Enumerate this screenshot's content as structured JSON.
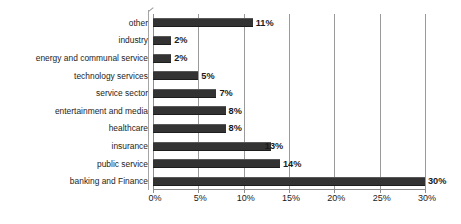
{
  "chart_data": {
    "type": "bar",
    "orientation": "horizontal",
    "title": "",
    "subtitle": "",
    "xlabel": "",
    "ylabel": "",
    "categories": [
      "other",
      "industry",
      "energy and communal service",
      "technology services",
      "service sector",
      "entertainment and media",
      "healthcare",
      "insurance",
      "public service",
      "banking and Finance"
    ],
    "values": [
      11,
      2,
      2,
      5,
      7,
      8,
      8,
      13,
      14,
      30
    ],
    "data_labels": [
      "11%",
      "2%",
      "2%",
      "5%",
      "7%",
      "8%",
      "8%",
      "13%",
      "14%",
      "30%"
    ],
    "xlim": [
      0,
      30
    ],
    "xticks": [
      0,
      5,
      10,
      15,
      20,
      25,
      30
    ],
    "xtick_labels": [
      "0%",
      "5%",
      "10%",
      "15%",
      "20%",
      "25%",
      "30%"
    ],
    "grid": true,
    "grid_axis": "x",
    "legend": false,
    "legend_position": "none",
    "bar_color": "#333333",
    "gridline_color": "#9a9a9a",
    "text_color": "#1a1a1a",
    "background_color": "#ffffff",
    "units": "percent"
  }
}
